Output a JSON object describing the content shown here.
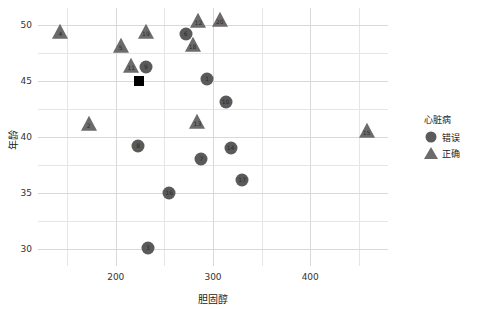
{
  "chart_data": {
    "type": "scatter",
    "title": "",
    "xlabel": "胆固醇",
    "ylabel": "年龄",
    "xlim": [
      120,
      480
    ],
    "ylim": [
      28.5,
      51.5
    ],
    "xticks": [
      200,
      300,
      400
    ],
    "yticks": [
      30,
      35,
      40,
      45,
      50
    ],
    "xticks_minor": [
      150,
      250,
      350,
      450
    ],
    "yticks_minor": [
      32.5,
      37.5,
      42.5,
      47.5
    ],
    "grid": true,
    "legend_position": "right",
    "legend": {
      "title": "心脏病",
      "entries": [
        {
          "label": "错误",
          "marker": "circle",
          "color": "#5a5a5a"
        },
        {
          "label": "正确",
          "marker": "triangle",
          "color": "#6b6b6b"
        }
      ]
    },
    "series": [
      {
        "name": "错误",
        "marker": "circle",
        "color": "#5a5a5a",
        "points": [
          {
            "label": "1",
            "x": 294,
            "y": 45.2
          },
          {
            "label": "3",
            "x": 233,
            "y": 30.1
          },
          {
            "label": "6",
            "x": 272,
            "y": 49.2
          },
          {
            "label": "7",
            "x": 288,
            "y": 38.0
          },
          {
            "label": "8",
            "x": 223,
            "y": 39.2
          },
          {
            "label": "9",
            "x": 231,
            "y": 46.2
          },
          {
            "label": "10",
            "x": 313,
            "y": 43.1
          },
          {
            "label": "14",
            "x": 318,
            "y": 39.0
          },
          {
            "label": "16",
            "x": 255,
            "y": 35.0
          },
          {
            "label": "17",
            "x": 330,
            "y": 36.2
          }
        ]
      },
      {
        "name": "正确",
        "marker": "triangle",
        "color": "#6b6b6b",
        "points": [
          {
            "label": "2",
            "x": 172,
            "y": 41.2
          },
          {
            "label": "4",
            "x": 143,
            "y": 49.4
          },
          {
            "label": "5",
            "x": 205,
            "y": 48.1
          },
          {
            "label": "11",
            "x": 216,
            "y": 46.3
          },
          {
            "label": "12",
            "x": 285,
            "y": 50.3
          },
          {
            "label": "13",
            "x": 284,
            "y": 41.3
          },
          {
            "label": "15",
            "x": 458,
            "y": 40.5
          },
          {
            "label": "18",
            "x": 279,
            "y": 48.2
          },
          {
            "label": "19",
            "x": 231,
            "y": 49.4
          },
          {
            "label": "20",
            "x": 307,
            "y": 50.4
          }
        ]
      },
      {
        "name": "centroid",
        "marker": "square",
        "color": "#000000",
        "points": [
          {
            "label": "",
            "x": 224,
            "y": 45.0
          }
        ]
      }
    ]
  }
}
